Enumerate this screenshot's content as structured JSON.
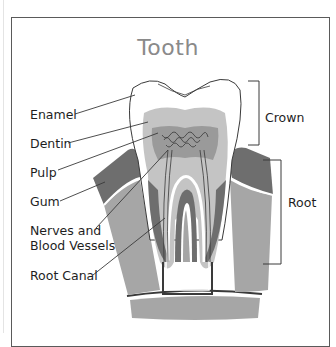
{
  "title": "Tooth",
  "labels": {
    "enamel": "Enamel",
    "dentin": "Dentin",
    "pulp": "Pulp",
    "gum": "Gum",
    "nerves_line1": "Nerves and",
    "nerves_line2": "Blood Vessels",
    "root_canal": "Root Canal",
    "crown": "Crown",
    "root": "Root"
  },
  "colors": {
    "frame": "#5a5a5a",
    "title": "#8a8a8a",
    "enamel": "#ffffff",
    "dentin": "#c4c4c4",
    "pulp": "#9a9a9a",
    "gum": "#6e6e6e",
    "bone": "#a6a6a6",
    "nerve": "#3a3a3a"
  }
}
